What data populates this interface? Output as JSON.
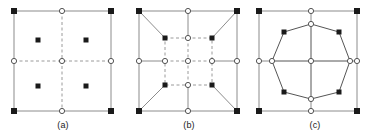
{
  "figure": {
    "background_color": "#ffffff",
    "stroke_color": "#8c8c8c",
    "dashed_color": "#9a9a9a",
    "marker_fill_color": "#1a1a1a",
    "marker_open_fill": "#ffffff",
    "panel_count": 3
  },
  "panels": [
    {
      "id": "a",
      "caption": "(a)",
      "description": "Square element with dashed centerlines, open circle nodes at corners midpoints and center, filled square corner nodes, and four filled interior integration points",
      "outer_square": {
        "x0": 14,
        "y0": 11,
        "x1": 111,
        "y1": 111
      },
      "corner_markers": {
        "type": "filled-square",
        "points": [
          [
            14,
            11
          ],
          [
            111,
            11
          ],
          [
            14,
            111
          ],
          [
            111,
            111
          ]
        ]
      },
      "midedge_markers": {
        "type": "open-circle",
        "points": [
          [
            62,
            11
          ],
          [
            14,
            61
          ],
          [
            111,
            61
          ],
          [
            62,
            111
          ]
        ]
      },
      "center_marker": {
        "type": "open-circle",
        "points": [
          [
            62,
            61
          ]
        ]
      },
      "interior_points": {
        "type": "filled-square",
        "points": [
          [
            38,
            40
          ],
          [
            86,
            40
          ],
          [
            38,
            86
          ],
          [
            86,
            86
          ]
        ]
      },
      "dashed_lines": [
        {
          "x1": 62,
          "y1": 11,
          "x2": 62,
          "y2": 111
        },
        {
          "x1": 14,
          "y1": 61,
          "x2": 111,
          "y2": 61
        }
      ]
    },
    {
      "id": "b",
      "caption": "(b)",
      "description": "Square element with an inner dashed sub-square, diagonals from outer corners to inner corners, filled square markers on inner corners and outer corners, open circle markers at mid edges and center",
      "outer_square": {
        "x0": 139,
        "y0": 11,
        "x1": 237,
        "y1": 111
      },
      "inner_square": {
        "x0": 165,
        "y0": 38,
        "x1": 212,
        "y1": 85
      },
      "corner_markers": {
        "type": "filled-square",
        "points": [
          [
            139,
            11
          ],
          [
            237,
            11
          ],
          [
            139,
            111
          ],
          [
            237,
            111
          ]
        ]
      },
      "midedge_markers": {
        "type": "open-circle",
        "points": [
          [
            188,
            11
          ],
          [
            139,
            61
          ],
          [
            237,
            61
          ],
          [
            188,
            111
          ]
        ]
      },
      "center_marker": {
        "type": "open-circle",
        "points": [
          [
            188,
            61
          ]
        ]
      },
      "inner_corner_markers": {
        "type": "filled-square",
        "points": [
          [
            165,
            38
          ],
          [
            212,
            38
          ],
          [
            165,
            85
          ],
          [
            212,
            85
          ]
        ]
      },
      "inner_midedge_markers": {
        "type": "open-circle",
        "points": [
          [
            188,
            38
          ],
          [
            165,
            61
          ],
          [
            212,
            61
          ],
          [
            188,
            85
          ]
        ]
      },
      "diagonals": [
        {
          "x1": 139,
          "y1": 11,
          "x2": 165,
          "y2": 38
        },
        {
          "x1": 237,
          "y1": 11,
          "x2": 212,
          "y2": 38
        },
        {
          "x1": 139,
          "y1": 111,
          "x2": 165,
          "y2": 85
        },
        {
          "x1": 237,
          "y1": 111,
          "x2": 212,
          "y2": 85
        }
      ]
    },
    {
      "id": "c",
      "caption": "(c)",
      "description": "Square element with an inscribed octagon, filled square markers at octagon diagonal vertices, open circle markers at octagon edge midpoints, center and square edge midpoints",
      "outer_square": {
        "x0": 259,
        "y0": 11,
        "x1": 357,
        "y1": 111
      },
      "corner_markers": {
        "type": "filled-square",
        "points": [
          [
            259,
            11
          ],
          [
            357,
            11
          ],
          [
            259,
            111
          ],
          [
            357,
            111
          ]
        ]
      },
      "midedge_markers": {
        "type": "open-circle",
        "points": [
          [
            311,
            11
          ],
          [
            259,
            61
          ],
          [
            357,
            61
          ],
          [
            311,
            111
          ]
        ]
      },
      "center_marker": {
        "type": "open-circle",
        "points": [
          [
            311,
            61
          ]
        ]
      },
      "octagon_vertices_filled": {
        "type": "filled-square",
        "points": [
          [
            284,
            32
          ],
          [
            339,
            32
          ],
          [
            284,
            92
          ],
          [
            339,
            92
          ]
        ]
      },
      "octagon_vertices_open": {
        "type": "open-circle",
        "points": [
          [
            311,
            24
          ],
          [
            272,
            61
          ],
          [
            350,
            61
          ],
          [
            311,
            99
          ]
        ]
      },
      "octagon_path": [
        [
          311,
          24
        ],
        [
          339,
          32
        ],
        [
          350,
          61
        ],
        [
          339,
          92
        ],
        [
          311,
          99
        ],
        [
          284,
          92
        ],
        [
          272,
          61
        ],
        [
          284,
          32
        ]
      ],
      "cross_lines": [
        {
          "x1": 272,
          "y1": 61,
          "x2": 350,
          "y2": 61
        },
        {
          "x1": 311,
          "y1": 24,
          "x2": 311,
          "y2": 99
        }
      ]
    }
  ]
}
